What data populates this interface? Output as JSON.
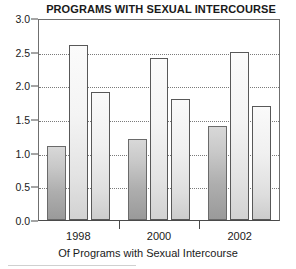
{
  "chart_data": {
    "type": "bar",
    "title": "PROGRAMS WITH SEXUAL INTERCOURSE",
    "xlabel": "Of Programs with Sexual Intercourse",
    "ylabel": "",
    "categories": [
      "1998",
      "2000",
      "2002"
    ],
    "series": [
      {
        "name": "series-1",
        "values": [
          1.1,
          1.2,
          1.4
        ],
        "style": "dark"
      },
      {
        "name": "series-2",
        "values": [
          2.6,
          2.4,
          2.5
        ],
        "style": "light"
      },
      {
        "name": "series-3",
        "values": [
          1.9,
          1.8,
          1.7
        ],
        "style": "mid"
      }
    ],
    "ylim": [
      0.0,
      3.0
    ],
    "yticks": [
      "0.0",
      "0.5",
      "1.0",
      "1.5",
      "2.0",
      "2.5",
      "3.0"
    ],
    "ytick_values": [
      0.0,
      0.5,
      1.0,
      1.5,
      2.0,
      2.5,
      3.0
    ],
    "grid": true,
    "grid_axis": "y",
    "legend": "none",
    "colors": {
      "series_dark": "#aeaeae",
      "series_light": "#f0f0f0",
      "series_mid": "#e6e6e6",
      "axis": "#4a4a4a",
      "grid": "#7a7a7a",
      "text": "#1a1a1a",
      "background": "#ffffff"
    }
  }
}
